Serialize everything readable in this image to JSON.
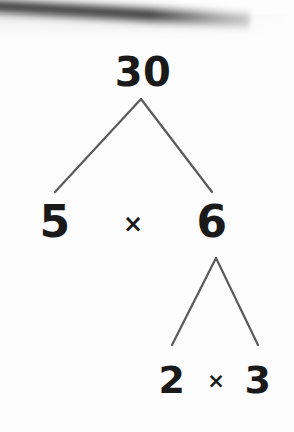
{
  "image": {
    "subject": "factor-tree",
    "background_color": "#fdfdfd",
    "ink_color": "#1a1a1a",
    "branch_color": "#5a5a5a",
    "top_band_color": "#2a2a2a"
  },
  "tree": {
    "root": {
      "value": "30"
    },
    "level1": {
      "left": "5",
      "operator": "×",
      "right": "6"
    },
    "level2": {
      "left": "2",
      "operator": "×",
      "right": "3"
    }
  },
  "branches": {
    "upper": {
      "apex_x": 141,
      "apex_y": 99,
      "left_x": 55,
      "left_y": 192,
      "right_x": 212,
      "right_y": 192
    },
    "lower": {
      "apex_x": 216,
      "apex_y": 258,
      "left_x": 172,
      "left_y": 345,
      "right_x": 258,
      "right_y": 345
    }
  }
}
